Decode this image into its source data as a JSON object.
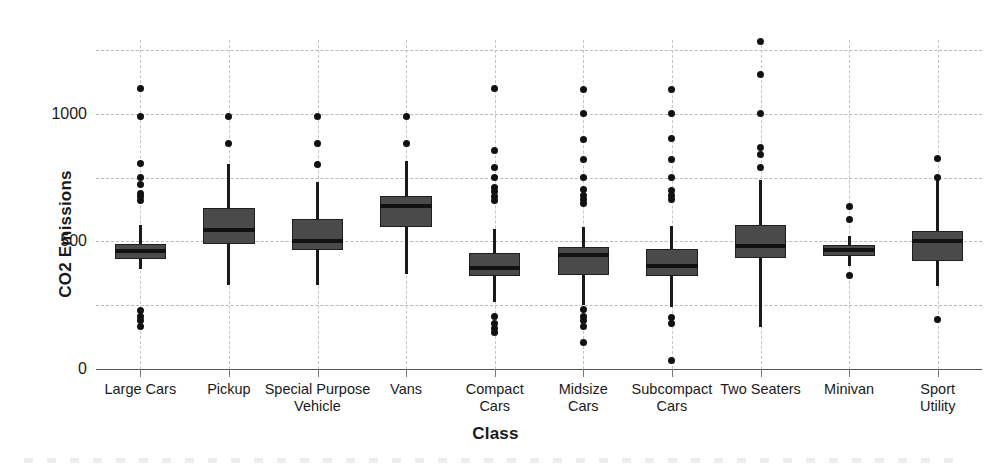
{
  "chart_data": {
    "type": "box",
    "title": "",
    "xlabel": "Class",
    "ylabel": "CO2 Emissions",
    "ylim": [
      0,
      1290
    ],
    "ytick_values": [
      0,
      500,
      1000
    ],
    "ytick_labels": [
      "0",
      "500",
      "1000"
    ],
    "gridlines_y": [
      0,
      250,
      500,
      750,
      1000,
      1250
    ],
    "grid": true,
    "legend": "none",
    "categories": [
      "Large Cars",
      "Pickup",
      "Special Purpose\nVehicle",
      "Vans",
      "Compact\nCars",
      "Midsize\nCars",
      "Subcompact\nCars",
      "Two Seaters",
      "Minivan",
      "Sport Utility"
    ],
    "boxes": [
      {
        "category": "Large Cars",
        "whisker_low": 392,
        "q1": 430,
        "median": 462,
        "q3": 492,
        "whisker_high": 565,
        "outliers": [
          1100,
          990,
          805,
          752,
          722,
          690,
          675,
          660,
          230,
          205,
          190,
          165
        ]
      },
      {
        "category": "Pickup",
        "whisker_low": 330,
        "q1": 490,
        "median": 545,
        "q3": 630,
        "whisker_high": 805,
        "outliers": [
          990,
          885
        ]
      },
      {
        "category": "Special Purpose Vehicle",
        "whisker_low": 330,
        "q1": 465,
        "median": 500,
        "q3": 590,
        "whisker_high": 735,
        "outliers": [
          990,
          885,
          800
        ]
      },
      {
        "category": "Vans",
        "whisker_low": 372,
        "q1": 555,
        "median": 640,
        "q3": 680,
        "whisker_high": 815,
        "outliers": [
          990,
          885
        ]
      },
      {
        "category": "Compact Cars",
        "whisker_low": 262,
        "q1": 363,
        "median": 395,
        "q3": 455,
        "whisker_high": 550,
        "outliers": [
          1100,
          855,
          790,
          750,
          712,
          695,
          678,
          660,
          205,
          178,
          160,
          142
        ]
      },
      {
        "category": "Midsize Cars",
        "whisker_low": 250,
        "q1": 370,
        "median": 447,
        "q3": 480,
        "whisker_high": 555,
        "outliers": [
          1095,
          1000,
          900,
          820,
          750,
          705,
          682,
          665,
          650,
          232,
          205,
          190,
          165,
          105
        ]
      },
      {
        "category": "Subcompact Cars",
        "whisker_low": 245,
        "q1": 365,
        "median": 405,
        "q3": 470,
        "whisker_high": 560,
        "outliers": [
          1095,
          1000,
          905,
          820,
          750,
          700,
          682,
          665,
          200,
          180,
          35
        ]
      },
      {
        "category": "Two Seaters",
        "whisker_low": 163,
        "q1": 435,
        "median": 483,
        "q3": 565,
        "whisker_high": 742,
        "outliers": [
          1285,
          1155,
          1000,
          870,
          840,
          790
        ]
      },
      {
        "category": "Minivan",
        "whisker_low": 405,
        "q1": 443,
        "median": 465,
        "q3": 485,
        "whisker_high": 520,
        "outliers": [
          638,
          585,
          368
        ]
      },
      {
        "category": "Sport Utility",
        "whisker_low": 325,
        "q1": 425,
        "median": 500,
        "q3": 540,
        "whisker_high": 745,
        "outliers": [
          825,
          752,
          193
        ]
      }
    ],
    "colors": {
      "box_fill": "#4a4a4a",
      "box_edge": "#1f1f1f",
      "median": "#121212",
      "whisker": "#1a1a1a",
      "outlier": "#111111",
      "grid": "#b9b9b9",
      "axis": "#555555",
      "text": "#1a1a1a",
      "background": "#ffffff"
    }
  }
}
